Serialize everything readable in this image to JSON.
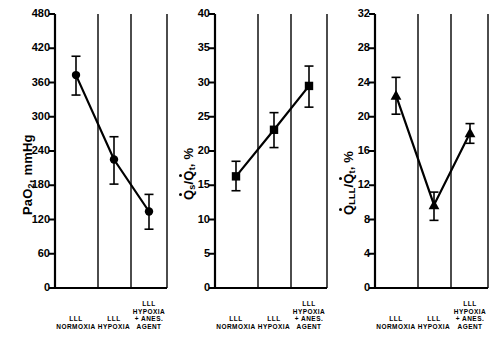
{
  "figure": {
    "background": "#ffffff",
    "ink": "#000000",
    "panel_count": 3
  },
  "chart_data": [
    {
      "type": "line",
      "panel_index": 0,
      "title": "",
      "xlabel": "",
      "ylabel": "PaO2, mmHg",
      "ylabel_parts": {
        "prefix": "P",
        "a": "a",
        "o": "O",
        "sub": "2",
        "suffix": ", mmHg"
      },
      "ylim": [
        0,
        480
      ],
      "yticks": [
        0,
        60,
        120,
        180,
        240,
        300,
        360,
        420,
        480
      ],
      "ytick_labels": [
        "0",
        "60",
        "120",
        "180",
        "240",
        "300",
        "360",
        "420",
        "480"
      ],
      "grid": false,
      "legend": "none",
      "marker": "circle",
      "categories": [
        "LLL NORMOXIA",
        "LLL HYPOXIA",
        "LLL HYPOXIA + ANES. AGENT"
      ],
      "values": [
        373,
        225,
        134
      ],
      "err_low": [
        35,
        43,
        31
      ],
      "err_high": [
        33,
        40,
        30
      ]
    },
    {
      "type": "line",
      "panel_index": 1,
      "title": "",
      "xlabel": "",
      "ylabel": "Qs/Qt, %",
      "ylabel_parts": {
        "q1": "Q",
        "sub1": "s",
        "slash": "/",
        "q2": "Q",
        "sub2": "t",
        "suffix": ", %"
      },
      "ylim": [
        0,
        40
      ],
      "yticks": [
        0,
        5,
        10,
        15,
        20,
        25,
        30,
        35,
        40
      ],
      "ytick_labels": [
        "0",
        "5",
        "10",
        "15",
        "20",
        "25",
        "30",
        "35",
        "40"
      ],
      "grid": false,
      "legend": "none",
      "marker": "square",
      "categories": [
        "LLL NORMOXIA",
        "LLL HYPOXIA",
        "LLL HYPOXIA + ANES. AGENT"
      ],
      "values": [
        16.3,
        23.1,
        29.5
      ],
      "err_low": [
        2.1,
        2.6,
        3.1
      ],
      "err_high": [
        2.2,
        2.5,
        2.9
      ]
    },
    {
      "type": "line",
      "panel_index": 2,
      "title": "",
      "xlabel": "",
      "ylabel": "QLLL/Qt, %",
      "ylabel_parts": {
        "q1": "Q",
        "sub1": "LLL",
        "slash": "/",
        "q2": "Q",
        "sub2": "t",
        "suffix": ", %"
      },
      "ylim": [
        0,
        32
      ],
      "yticks": [
        0,
        4,
        8,
        12,
        16,
        20,
        24,
        28,
        32
      ],
      "ytick_labels": [
        "0",
        "4",
        "8",
        "12",
        "16",
        "20",
        "24",
        "28",
        "32"
      ],
      "grid": false,
      "legend": "none",
      "marker": "triangle",
      "categories": [
        "LLL NORMOXIA",
        "LLL HYPOXIA",
        "LLL HYPOXIA + ANES. AGENT"
      ],
      "values": [
        22.5,
        9.7,
        18.1
      ],
      "err_low": [
        2.2,
        1.8,
        1.2
      ],
      "err_high": [
        2.1,
        1.5,
        1.1
      ]
    }
  ],
  "xaxis_groups": [
    {
      "line1": "",
      "line2": "",
      "line3": "LLL",
      "line4": "NORMOXIA"
    },
    {
      "line1": "",
      "line2": "",
      "line3": "LLL",
      "line4": "HYPOXIA"
    },
    {
      "line1": "LLL",
      "line2": "HYPOXIA",
      "line3": "+ ANES.",
      "line4": "AGENT"
    }
  ],
  "panels": [
    {
      "name": "pao2-panel",
      "ytick_labels": [
        "480",
        "420",
        "360",
        "300",
        "240",
        "180",
        "120",
        "60",
        "0"
      ]
    },
    {
      "name": "qsqt-panel",
      "ytick_labels": [
        "40",
        "35",
        "30",
        "25",
        "20",
        "15",
        "10",
        "5",
        "0"
      ]
    },
    {
      "name": "qlllqt-panel",
      "ytick_labels": [
        "32",
        "28",
        "24",
        "20",
        "16",
        "12",
        "8",
        "4",
        "0"
      ]
    }
  ]
}
